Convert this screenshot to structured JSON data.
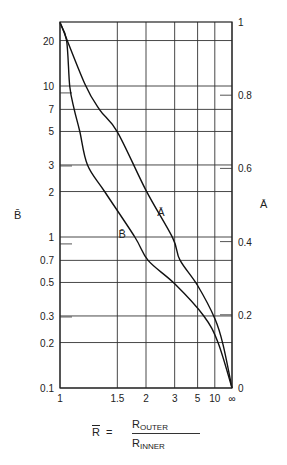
{
  "chart_data": {
    "type": "line",
    "title": "",
    "xlabel": "R̄ = R_OUTER / R_INNER",
    "xlabel_parts": {
      "lhs": "R",
      "eq": "=",
      "num_base": "R",
      "num_sub": "OUTER",
      "den_base": "R",
      "den_sub": "INNER"
    },
    "x_scale": "1 - 1/R (R from 1 to ∞)",
    "x_ticks": [
      "1",
      "1.5",
      "2",
      "3",
      "5",
      "10",
      "∞"
    ],
    "x_tick_values": [
      1,
      1.5,
      2,
      3,
      5,
      10,
      "inf"
    ],
    "left_axis": {
      "label": "B̄",
      "scale": "log",
      "range": [
        0.1,
        26
      ],
      "ticks": [
        "0.1",
        "0.2",
        "0.3",
        "0.5",
        "0.7",
        "1",
        "2",
        "3",
        "5",
        "7",
        "10",
        "20"
      ],
      "tick_values": [
        0.1,
        0.2,
        0.3,
        0.5,
        0.7,
        1,
        2,
        3,
        5,
        7,
        10,
        20
      ]
    },
    "right_axis": {
      "label": "Ā",
      "scale": "linear",
      "range": [
        0,
        1
      ],
      "ticks": [
        "0",
        "0.2",
        "0.4",
        "0.6",
        "0.8",
        "1"
      ],
      "tick_values": [
        0,
        0.2,
        0.4,
        0.6,
        0.8,
        1
      ]
    },
    "grid": true,
    "legend": "inline labels on curves",
    "series": [
      {
        "name": "Ā",
        "axis": "right",
        "label_pos": {
          "R": 2.3,
          "value": 0.48
        },
        "points": [
          {
            "R": 1.0,
            "v": 1.0
          },
          {
            "R": 1.17,
            "v": 0.83
          },
          {
            "R": 1.3,
            "v": 0.76
          },
          {
            "R": 1.5,
            "v": 0.7
          },
          {
            "R": 2.0,
            "v": 0.54
          },
          {
            "R": 2.9,
            "v": 0.41
          },
          {
            "R": 3.3,
            "v": 0.35
          },
          {
            "R": 5.0,
            "v": 0.28
          },
          {
            "R": 10.0,
            "v": 0.19
          },
          {
            "R": 19.0,
            "v": 0.12
          },
          {
            "R": "inf",
            "v": 0.0
          }
        ]
      },
      {
        "name": "B̄",
        "axis": "left",
        "label_pos": {
          "R": 1.6,
          "value": 1.25
        },
        "points": [
          {
            "R": 1.0,
            "v": 26
          },
          {
            "R": 1.04,
            "v": 20
          },
          {
            "R": 1.06,
            "v": 10
          },
          {
            "R": 1.09,
            "v": 7.0
          },
          {
            "R": 1.13,
            "v": 5.0
          },
          {
            "R": 1.19,
            "v": 3.0
          },
          {
            "R": 1.35,
            "v": 2.0
          },
          {
            "R": 1.77,
            "v": 1.0
          },
          {
            "R": 2.05,
            "v": 0.7
          },
          {
            "R": 3.0,
            "v": 0.49
          },
          {
            "R": 6.1,
            "v": 0.3
          },
          {
            "R": 12.3,
            "v": 0.2
          },
          {
            "R": "inf",
            "v": 0.1
          }
        ]
      }
    ],
    "extra_short_ticks_left": [
      9,
      0.9,
      3,
      0.3
    ],
    "extra_short_ticks_right": [
      0.8,
      0.6,
      0.4,
      0.2
    ]
  }
}
